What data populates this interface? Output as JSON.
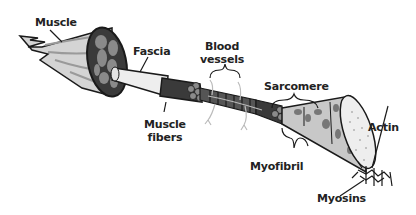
{
  "diagram": {
    "labels": {
      "muscle": "Muscle",
      "fascia": "Fascia",
      "blood_vessels_line1": "Blood",
      "blood_vessels_line2": "vessels",
      "sarcomere": "Sarcomere",
      "muscle_fibers_line1": "Muscle",
      "muscle_fibers_line2": "fibers",
      "myofibril": "Myofibril",
      "actin": "Actin",
      "myosins": "Myosins"
    },
    "colors": {
      "outline": "#1a1a1a",
      "dark_fill": "#3a3a3a",
      "mid_fill": "#8a8a8a",
      "light_fill": "#d8d8d8",
      "pale_fill": "#eeeeee",
      "vessel": "#bbbbbb"
    }
  }
}
